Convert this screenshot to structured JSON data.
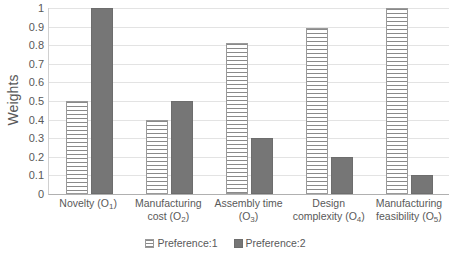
{
  "chart_data": {
    "type": "bar",
    "title": "",
    "xlabel": "",
    "ylabel": "Weights",
    "ylim": [
      0,
      1
    ],
    "ytick_step": 0.1,
    "yticks": [
      "1",
      "0.9",
      "0.8",
      "0.7",
      "0.6",
      "0.5",
      "0.4",
      "0.3",
      "0.2",
      "0.1",
      "0"
    ],
    "grid": true,
    "grid_axis": "y",
    "legend_position": "bottom-center",
    "orientation": "vertical",
    "grouping": "clustered",
    "categories": [
      "Novelty (O1)",
      "Manufacturing cost (O2)",
      "Assembly time (O3)",
      "Design complexity (O4)",
      "Manufacturing feasibility (O5)"
    ],
    "category_labels": [
      {
        "main": "Novelty (O",
        "sub": "1",
        "tail": ")",
        "lines": [
          "Novelty (O₁)"
        ]
      },
      {
        "main": "Manufacturing cost (O",
        "sub": "2",
        "tail": ")",
        "lines": [
          "Manufacturing",
          "cost (O₂)"
        ]
      },
      {
        "main": "Assembly time (O",
        "sub": "3",
        "tail": ")",
        "lines": [
          "Assembly time",
          "(O₃)"
        ]
      },
      {
        "main": "Design complexity (O",
        "sub": "4",
        "tail": ")",
        "lines": [
          "Design",
          "complexity (O₄)"
        ]
      },
      {
        "main": "Manufacturing feasibility (O",
        "sub": "5",
        "tail": ")",
        "lines": [
          "Manufacturing",
          "feasibility (O₅)"
        ]
      }
    ],
    "series": [
      {
        "name": "Preference:1",
        "color": "#ffffff",
        "pattern": "horizontal-stripes",
        "border_color": "#9a9a9a",
        "values": [
          0.5,
          0.4,
          0.81,
          0.89,
          1.0
        ]
      },
      {
        "name": "Preference:2",
        "color": "#767676",
        "pattern": "solid",
        "border_color": "#6d6d6d",
        "values": [
          1.0,
          0.5,
          0.3,
          0.2,
          0.1
        ]
      }
    ]
  },
  "legend": {
    "items": [
      {
        "label": "Preference:1"
      },
      {
        "label": "Preference:2"
      }
    ]
  }
}
